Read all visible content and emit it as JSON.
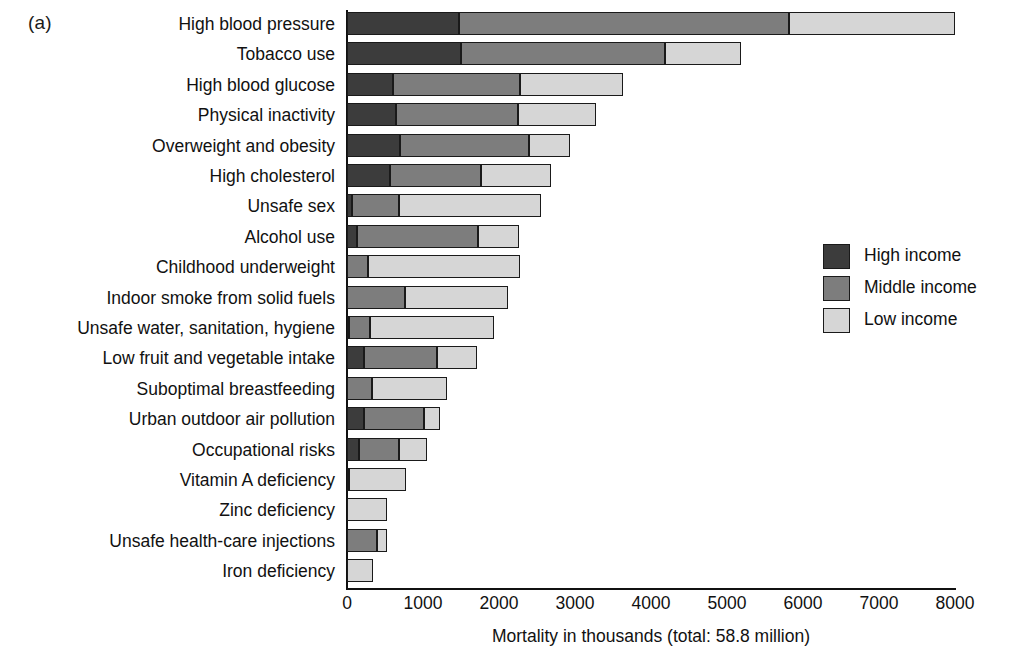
{
  "panel": {
    "letter": "(a)"
  },
  "chart_data": {
    "type": "bar",
    "orientation": "horizontal",
    "stacked": true,
    "title": "",
    "xlabel": "Mortality in thousands (total: 58.8 million)",
    "ylabel": "",
    "xlim": [
      0,
      8000
    ],
    "xticks": [
      0,
      1000,
      2000,
      3000,
      4000,
      5000,
      6000,
      7000,
      8000
    ],
    "xtick_labels": [
      "0",
      "1000",
      "2000",
      "3000",
      "4000",
      "5000",
      "6000",
      "7000",
      "8000"
    ],
    "grid": false,
    "legend_position": "right-middle",
    "categories": [
      "High blood pressure",
      "Tobacco use",
      "High blood glucose",
      "Physical inactivity",
      "Overweight and obesity",
      "High cholesterol",
      "Unsafe sex",
      "Alcohol use",
      "Childhood underweight",
      "Indoor smoke from solid fuels",
      "Unsafe water, sanitation, hygiene",
      "Low fruit and vegetable intake",
      "Suboptimal breastfeeding",
      "Urban outdoor air pollution",
      "Occupational risks",
      "Vitamin A deficiency",
      "Zinc deficiency",
      "Unsafe health-care injections",
      "Iron deficiency"
    ],
    "series": [
      {
        "name": "High income",
        "color": "#3c3c3c",
        "values": [
          1480,
          1500,
          600,
          640,
          700,
          560,
          60,
          130,
          0,
          0,
          30,
          230,
          0,
          220,
          160,
          30,
          0,
          0,
          0
        ]
      },
      {
        "name": "Middle income",
        "color": "#7d7d7d",
        "values": [
          4340,
          2680,
          1680,
          1610,
          1700,
          1200,
          620,
          1590,
          270,
          760,
          270,
          960,
          330,
          790,
          530,
          0,
          0,
          390,
          0
        ]
      },
      {
        "name": "Low income",
        "color": "#d6d6d6",
        "values": [
          2180,
          1000,
          1350,
          1030,
          530,
          930,
          1870,
          540,
          2000,
          1360,
          1630,
          520,
          980,
          220,
          360,
          750,
          520,
          140,
          340
        ]
      }
    ],
    "totals": [
      8000,
      5180,
      3630,
      3280,
      2930,
      2690,
      2550,
      2260,
      2270,
      2120,
      1930,
      1710,
      1310,
      1230,
      1050,
      780,
      520,
      530,
      340
    ]
  },
  "legend": {
    "items": [
      {
        "label": "High income",
        "swatch": "high"
      },
      {
        "label": "Middle income",
        "swatch": "mid"
      },
      {
        "label": "Low income",
        "swatch": "low"
      }
    ]
  },
  "colors": {
    "high_income": "#3c3c3c",
    "middle_income": "#7d7d7d",
    "low_income": "#d6d6d6",
    "axis": "#111111",
    "background": "#ffffff"
  }
}
